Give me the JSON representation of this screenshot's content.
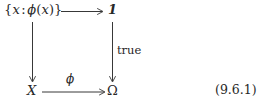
{
  "diagram": {
    "kind": "commutative-square",
    "equation_number": "(9.6.1)",
    "background_color": "#ffffff",
    "ink_color": "#272727",
    "nodes": {
      "top_left": {
        "name": "subset-comprehension",
        "open_brace": "{",
        "variable": "x",
        "colon": ":",
        "predicate_fn": "ϕ",
        "predicate_open": "(",
        "predicate_var": "x",
        "predicate_close": ")",
        "close_brace": "}",
        "plain_text": "{x : ϕ(x)}"
      },
      "top_right": {
        "name": "terminal-object",
        "text": "1",
        "style": "bold-italic"
      },
      "bottom_left": {
        "name": "domain-object",
        "text": "X",
        "style": "italic"
      },
      "bottom_right": {
        "name": "subobject-classifier",
        "text": "Ω",
        "style": "upright"
      }
    },
    "arrows": {
      "top": {
        "name": "top-horizontal-arrow",
        "from": "top_left",
        "to": "top_right",
        "label": ""
      },
      "right": {
        "name": "right-vertical-arrow",
        "from": "top_right",
        "to": "bottom_right",
        "label": "true",
        "label_style": "upright"
      },
      "left": {
        "name": "left-vertical-arrow",
        "from": "top_left",
        "to": "bottom_left",
        "label": ""
      },
      "bottom": {
        "name": "bottom-horizontal-arrow",
        "from": "bottom_left",
        "to": "bottom_right",
        "label": "ϕ",
        "label_style": "italic"
      }
    }
  }
}
